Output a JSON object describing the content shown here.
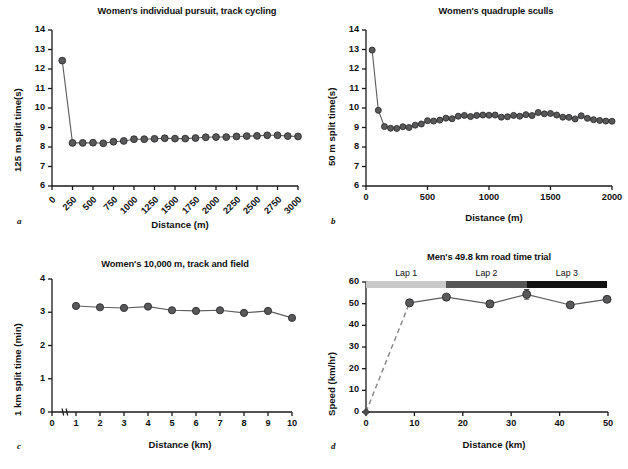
{
  "figure": {
    "background": "#ffffff",
    "marker_color": "#59595b",
    "marker_edge": "#2d2d2d",
    "line_color": "#5d5d5d"
  },
  "panels": [
    {
      "letter": "a",
      "title": "Women's individual pursuit, track cycling",
      "chart_data": {
        "type": "line",
        "title": "Women's individual pursuit, track cycling",
        "xlabel": "Distance (m)",
        "ylabel": "125 m split time(s)",
        "xlim": [
          0,
          3000
        ],
        "ylim": [
          6,
          14
        ],
        "xticks": [
          0,
          250,
          500,
          750,
          1000,
          1250,
          1500,
          1750,
          2000,
          2250,
          2500,
          2750,
          3000
        ],
        "xtick_labels": [
          "0",
          "250",
          "500",
          "750",
          "1000",
          "1250",
          "1500",
          "1750",
          "2000",
          "2250",
          "2500",
          "2750",
          "3000"
        ],
        "yticks": [
          6,
          7,
          8,
          9,
          10,
          11,
          12,
          13,
          14
        ],
        "ytick_labels": [
          "6",
          "7",
          "8",
          "9",
          "10",
          "11",
          "12",
          "13",
          "14"
        ],
        "grid": false,
        "legend": "none",
        "x": [
          125,
          250,
          375,
          500,
          625,
          750,
          875,
          1000,
          1125,
          1250,
          1375,
          1500,
          1625,
          1750,
          1875,
          2000,
          2125,
          2250,
          2375,
          2500,
          2625,
          2750,
          2875,
          3000
        ],
        "values": [
          12.43,
          8.21,
          8.21,
          8.22,
          8.19,
          8.27,
          8.31,
          8.4,
          8.4,
          8.42,
          8.45,
          8.43,
          8.43,
          8.46,
          8.5,
          8.51,
          8.51,
          8.54,
          8.56,
          8.57,
          8.6,
          8.6,
          8.56,
          8.54
        ]
      }
    },
    {
      "letter": "b",
      "title": "Women's quadruple sculls",
      "chart_data": {
        "type": "line",
        "title": "Women's quadruple sculls",
        "xlabel": "Distance (m)",
        "ylabel": "50 m split time(s)",
        "xlim": [
          0,
          2000
        ],
        "ylim": [
          6,
          14
        ],
        "xticks": [
          0,
          500,
          1000,
          1500,
          2000
        ],
        "xtick_labels": [
          "0",
          "500",
          "1000",
          "1500",
          "2000"
        ],
        "yticks": [
          6,
          7,
          8,
          9,
          10,
          11,
          12,
          13,
          14
        ],
        "ytick_labels": [
          "6",
          "7",
          "8",
          "9",
          "10",
          "11",
          "12",
          "13",
          "14"
        ],
        "grid": false,
        "legend": "none",
        "x": [
          50,
          100,
          150,
          200,
          250,
          300,
          350,
          400,
          450,
          500,
          550,
          600,
          650,
          700,
          750,
          800,
          850,
          900,
          950,
          1000,
          1050,
          1100,
          1150,
          1200,
          1250,
          1300,
          1350,
          1400,
          1450,
          1500,
          1550,
          1600,
          1650,
          1700,
          1750,
          1800,
          1850,
          1900,
          1950,
          2000
        ],
        "values": [
          12.97,
          9.88,
          9.05,
          8.96,
          8.95,
          9.04,
          9.0,
          9.12,
          9.18,
          9.35,
          9.33,
          9.38,
          9.48,
          9.45,
          9.58,
          9.62,
          9.56,
          9.62,
          9.64,
          9.63,
          9.64,
          9.53,
          9.55,
          9.62,
          9.58,
          9.66,
          9.61,
          9.77,
          9.7,
          9.72,
          9.64,
          9.53,
          9.52,
          9.44,
          9.6,
          9.47,
          9.4,
          9.36,
          9.33,
          9.32
        ]
      }
    },
    {
      "letter": "c",
      "title": "Women's 10,000 m, track and field",
      "chart_data": {
        "type": "line",
        "title": "Women's 10,000 m, track and field",
        "xlabel": "Distance (km)",
        "ylabel": "1 km split time (min)",
        "xlim": [
          0,
          10
        ],
        "ylim": [
          0,
          4
        ],
        "xticks": [
          0,
          1,
          2,
          3,
          4,
          5,
          6,
          7,
          8,
          9,
          10
        ],
        "xtick_labels": [
          "0",
          "1",
          "2",
          "3",
          "4",
          "5",
          "6",
          "7",
          "8",
          "9",
          "10"
        ],
        "yticks": [
          0,
          1,
          2,
          3,
          4
        ],
        "ytick_labels": [
          "0",
          "1",
          "2",
          "3",
          "4"
        ],
        "grid": false,
        "legend": "none",
        "axis_break_x": true,
        "x": [
          1,
          2,
          3,
          4,
          5,
          6,
          7,
          8,
          9,
          10
        ],
        "values": [
          3.19,
          3.15,
          3.13,
          3.17,
          3.06,
          3.04,
          3.06,
          2.98,
          3.04,
          2.83
        ]
      }
    },
    {
      "letter": "d",
      "title": "Men's 49.8 km road time trial",
      "chart_data": {
        "type": "line",
        "title": "Men's 49.8 km road time trial",
        "xlabel": "Distance (km)",
        "ylabel": "Speed (km/hr)",
        "xlim": [
          0,
          50
        ],
        "ylim": [
          0,
          60
        ],
        "xticks": [
          0,
          10,
          20,
          30,
          40,
          50
        ],
        "xtick_labels": [
          "0",
          "10",
          "20",
          "30",
          "40",
          "50"
        ],
        "yticks": [
          0,
          10,
          20,
          30,
          40,
          50,
          60
        ],
        "ytick_labels": [
          "0",
          "10",
          "20",
          "30",
          "40",
          "50",
          "60"
        ],
        "grid": false,
        "legend": "none",
        "x": [
          0,
          9.0,
          16.6,
          25.6,
          33.2,
          42.2,
          49.8
        ],
        "values": [
          0,
          50.4,
          53.0,
          49.9,
          54.3,
          49.4,
          52.0
        ],
        "errors": [
          0,
          1.4,
          1.1,
          1.5,
          2.2,
          1.0,
          1.0
        ],
        "dashed_segment": [
          0,
          1
        ],
        "laps": [
          {
            "label": "Lap 1",
            "x_start": 0,
            "x_end": 16.6,
            "color": "#c9c9c9"
          },
          {
            "label": "Lap 2",
            "x_start": 16.6,
            "x_end": 33.2,
            "color": "#555555"
          },
          {
            "label": "Lap 3",
            "x_start": 33.2,
            "x_end": 49.8,
            "color": "#111111"
          }
        ]
      }
    }
  ]
}
